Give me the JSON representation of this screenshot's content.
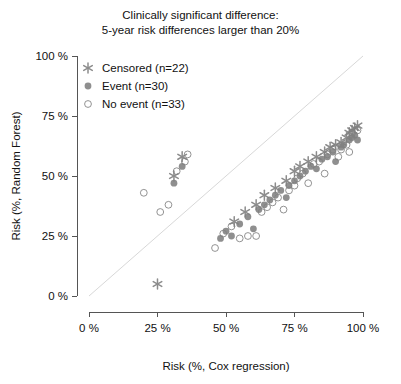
{
  "chart_data": {
    "type": "scatter",
    "title": "Clinically significant difference:\n5-year risk differences larger than 20%",
    "xlabel": "Risk (%, Cox regression)",
    "ylabel": "Risk (%, Random Forest)",
    "xlim": [
      0,
      100
    ],
    "ylim": [
      0,
      100
    ],
    "xticks": [
      0,
      25,
      50,
      75,
      100
    ],
    "yticks": [
      0,
      25,
      50,
      75,
      100
    ],
    "xtick_labels": [
      "0 %",
      "25 %",
      "50 %",
      "75 %",
      "100 %"
    ],
    "ytick_labels": [
      "0 %",
      "25 %",
      "50 %",
      "75 %",
      "100 %"
    ],
    "grid": false,
    "legend_position": "top-left",
    "reference_line": {
      "type": "identity",
      "label": "y = x",
      "color": "#d8d8d8"
    },
    "marker_color": "#808080",
    "series": [
      {
        "name": "Censored (n=22)",
        "marker": "asterisk",
        "n": 22,
        "points": [
          [
            25.0,
            5.0
          ],
          [
            34.0,
            58.0
          ],
          [
            31.0,
            50.0
          ],
          [
            53.0,
            31.0
          ],
          [
            57.0,
            35.0
          ],
          [
            61.0,
            38.0
          ],
          [
            64.0,
            42.0
          ],
          [
            68.0,
            45.0
          ],
          [
            72.0,
            48.0
          ],
          [
            75.0,
            52.0
          ],
          [
            77.0,
            54.0
          ],
          [
            80.0,
            56.0
          ],
          [
            83.0,
            58.0
          ],
          [
            86.0,
            60.0
          ],
          [
            88.0,
            62.0
          ],
          [
            90.0,
            63.0
          ],
          [
            92.0,
            64.0
          ],
          [
            94.0,
            66.0
          ],
          [
            95.0,
            68.0
          ],
          [
            96.0,
            69.0
          ],
          [
            97.0,
            70.0
          ],
          [
            98.0,
            71.0
          ]
        ]
      },
      {
        "name": "Event (n=30)",
        "marker": "filled-circle",
        "n": 30,
        "points": [
          [
            34.0,
            54.0
          ],
          [
            31.0,
            47.0
          ],
          [
            48.0,
            24.0
          ],
          [
            50.0,
            27.0
          ],
          [
            52.0,
            25.0
          ],
          [
            55.0,
            30.0
          ],
          [
            58.0,
            33.0
          ],
          [
            60.0,
            28.0
          ],
          [
            62.0,
            36.0
          ],
          [
            64.0,
            38.0
          ],
          [
            66.0,
            40.0
          ],
          [
            68.0,
            42.0
          ],
          [
            70.0,
            44.0
          ],
          [
            72.0,
            41.0
          ],
          [
            73.0,
            46.0
          ],
          [
            75.0,
            48.0
          ],
          [
            77.0,
            50.0
          ],
          [
            79.0,
            52.0
          ],
          [
            81.0,
            54.0
          ],
          [
            83.0,
            53.0
          ],
          [
            85.0,
            57.0
          ],
          [
            87.0,
            58.0
          ],
          [
            89.0,
            60.0
          ],
          [
            90.0,
            56.0
          ],
          [
            92.0,
            62.0
          ],
          [
            93.0,
            63.0
          ],
          [
            95.0,
            65.0
          ],
          [
            96.0,
            66.0
          ],
          [
            97.0,
            67.0
          ],
          [
            98.0,
            65.0
          ]
        ]
      },
      {
        "name": "No event (n=33)",
        "marker": "open-circle",
        "n": 33,
        "points": [
          [
            20.0,
            43.0
          ],
          [
            26.0,
            35.0
          ],
          [
            29.0,
            38.0
          ],
          [
            32.0,
            52.0
          ],
          [
            35.0,
            56.0
          ],
          [
            36.0,
            59.0
          ],
          [
            46.0,
            20.0
          ],
          [
            49.0,
            26.0
          ],
          [
            52.0,
            29.0
          ],
          [
            55.0,
            24.0
          ],
          [
            58.0,
            25.0
          ],
          [
            61.0,
            25.0
          ],
          [
            63.0,
            35.0
          ],
          [
            65.0,
            37.0
          ],
          [
            67.0,
            39.0
          ],
          [
            69.0,
            41.0
          ],
          [
            71.0,
            36.0
          ],
          [
            73.0,
            44.0
          ],
          [
            75.0,
            46.0
          ],
          [
            76.0,
            49.0
          ],
          [
            78.0,
            51.0
          ],
          [
            80.0,
            47.0
          ],
          [
            82.0,
            55.0
          ],
          [
            84.0,
            56.0
          ],
          [
            86.0,
            51.0
          ],
          [
            87.0,
            59.0
          ],
          [
            89.0,
            61.0
          ],
          [
            91.0,
            58.0
          ],
          [
            92.0,
            61.0
          ],
          [
            94.0,
            63.0
          ],
          [
            95.0,
            60.0
          ],
          [
            96.0,
            68.0
          ],
          [
            98.0,
            69.0
          ]
        ]
      }
    ]
  },
  "legend": {
    "items": [
      {
        "label": "Censored (n=22)",
        "marker": "asterisk"
      },
      {
        "label": "Event (n=30)",
        "marker": "filled-circle"
      },
      {
        "label": "No event (n=33)",
        "marker": "open-circle"
      }
    ]
  }
}
